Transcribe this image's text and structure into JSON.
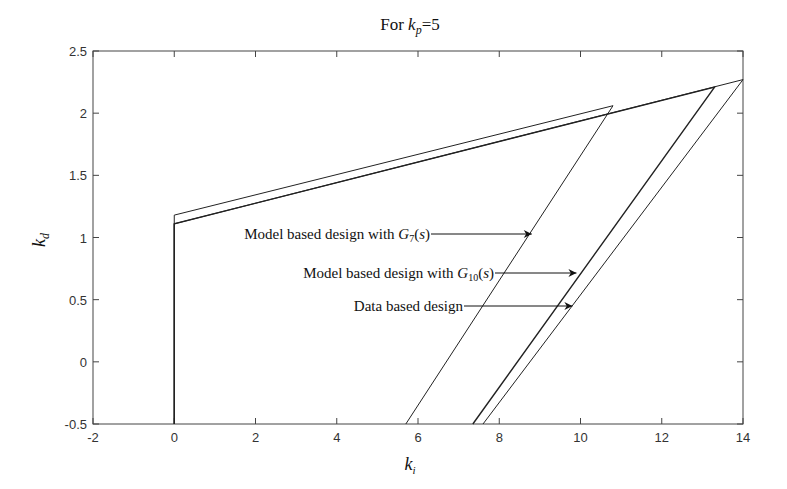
{
  "chart_data": {
    "type": "line",
    "title_parts": {
      "prefix": "For ",
      "var": "k",
      "sub": "p",
      "suffix": "=5"
    },
    "xlabel": "k_i",
    "ylabel": "k_d",
    "xlim": [
      -2,
      14
    ],
    "ylim": [
      -0.5,
      2.5
    ],
    "xticks": [
      -2,
      0,
      2,
      4,
      6,
      8,
      10,
      12,
      14
    ],
    "yticks": [
      -0.5,
      0,
      0.5,
      1,
      1.5,
      2,
      2.5
    ],
    "xtick_labels": [
      "-2",
      "0",
      "2",
      "4",
      "6",
      "8",
      "10",
      "12",
      "14"
    ],
    "ytick_labels": [
      "-0.5",
      "0",
      "0.5",
      "1",
      "1.5",
      "2",
      "2.5"
    ],
    "grid": false,
    "legend": null,
    "series": [
      {
        "name": "Model based design with G7(s)",
        "points": [
          [
            0,
            -0.5
          ],
          [
            0,
            1.18
          ],
          [
            10.8,
            2.06
          ],
          [
            5.7,
            -0.5
          ]
        ]
      },
      {
        "name": "Model based design with G10(s)",
        "points": [
          [
            0,
            -0.5
          ],
          [
            0,
            1.11
          ],
          [
            13.3,
            2.21
          ],
          [
            7.35,
            -0.5
          ]
        ]
      },
      {
        "name": "Data based design",
        "points": [
          [
            0,
            -0.5
          ],
          [
            0,
            1.11
          ],
          [
            14.0,
            2.27
          ],
          [
            7.6,
            -0.5
          ]
        ]
      }
    ],
    "annotations": [
      {
        "text": "Model based design with G7(s)",
        "prefix": "Model based design with ",
        "var": "G",
        "sub": "7",
        "suffix": "(s)",
        "arrow_to": [
          8.8,
          1.02
        ]
      },
      {
        "text": "Model based design with G10(s)",
        "prefix": "Model based design with ",
        "var": "G",
        "sub": "10",
        "suffix": "(s)",
        "arrow_to": [
          9.9,
          0.69
        ]
      },
      {
        "text": "Data based design",
        "prefix": "Data based design",
        "var": "",
        "sub": "",
        "suffix": "",
        "arrow_to": [
          9.8,
          0.43
        ]
      }
    ]
  }
}
